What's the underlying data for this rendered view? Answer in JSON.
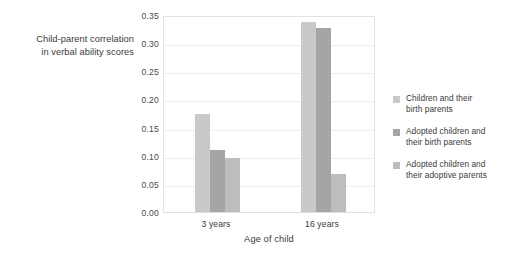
{
  "chart_data": {
    "type": "bar",
    "title": "",
    "xlabel": "Age of child",
    "ylabel": "Child-parent correlation in verbal ability scores",
    "ylabel_lines": [
      "Child-parent correlation",
      "in verbal ability scores"
    ],
    "categories": [
      "3 years",
      "16 years"
    ],
    "ylim": [
      0.0,
      0.35
    ],
    "ytick_labels": [
      "0.35",
      "0.30",
      "0.25",
      "0.20",
      "0.15",
      "0.10",
      "0.05",
      "0.00"
    ],
    "ytick_values": [
      0.35,
      0.3,
      0.25,
      0.2,
      0.15,
      0.1,
      0.05,
      0.0
    ],
    "grid": true,
    "grid_axis": "y",
    "legend_position": "right",
    "series": [
      {
        "name": "Children and their birth parents",
        "name_lines": [
          "Children and their",
          "birth parents"
        ],
        "color": "#c9c9c9",
        "values": [
          0.175,
          0.337
        ]
      },
      {
        "name": "Adopted children and their birth parents",
        "name_lines": [
          "Adopted children and",
          "their birth parents"
        ],
        "color": "#a5a5a5",
        "values": [
          0.11,
          0.327
        ]
      },
      {
        "name": "Adopted children and their adoptive parents",
        "name_lines": [
          "Adopted children and",
          "their adoptive parents"
        ],
        "color": "#bdbdbd",
        "values": [
          0.096,
          0.068
        ]
      }
    ]
  },
  "colors": {
    "plot_border": "#e2e2e2",
    "gridline": "#ededed",
    "text": "#3a3a3a",
    "background": "#ffffff"
  }
}
